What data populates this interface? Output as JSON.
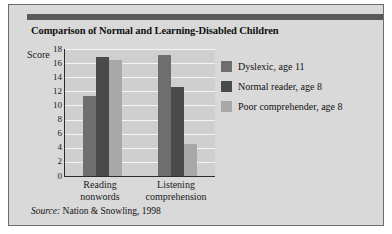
{
  "figure": {
    "title": "Comparison of Normal and Learning-Disabled Children",
    "source_prefix": "Source:",
    "source_text": "Nation & Snowling, 1998",
    "frame_color": "#d9d9d9",
    "accent_bar_color": "#5a5a5a",
    "plot_background": "#cfcfcf",
    "gridline_color": "#f4f4f4",
    "axis_color": "#2b2b2b"
  },
  "chart_data": {
    "type": "bar",
    "title": "Comparison of Normal and Learning-Disabled Children",
    "xlabel": "",
    "ylabel": "Score",
    "categories": [
      "Reading nonwords",
      "Listening comprehension"
    ],
    "category_lines": [
      [
        "Reading",
        "nonwords"
      ],
      [
        "Listening",
        "comprehension"
      ]
    ],
    "series": [
      {
        "name": "Dyslexic, age 11",
        "color": "#6e6e6e",
        "values": [
          11.4,
          17.2
        ]
      },
      {
        "name": "Normal reader, age 8",
        "color": "#4a4a4a",
        "values": [
          16.9,
          12.6
        ]
      },
      {
        "name": "Poor comprehender, age 8",
        "color": "#a8a8a8",
        "values": [
          16.5,
          4.5
        ]
      }
    ],
    "ylim": [
      0,
      18
    ],
    "yticks": [
      0,
      2,
      4,
      6,
      8,
      10,
      12,
      14,
      16,
      18
    ],
    "ytick_labels": [
      "0",
      "2",
      "4",
      "6",
      "8",
      "10",
      "12",
      "14",
      "16",
      "18"
    ],
    "grid": true,
    "legend_position": "right"
  }
}
